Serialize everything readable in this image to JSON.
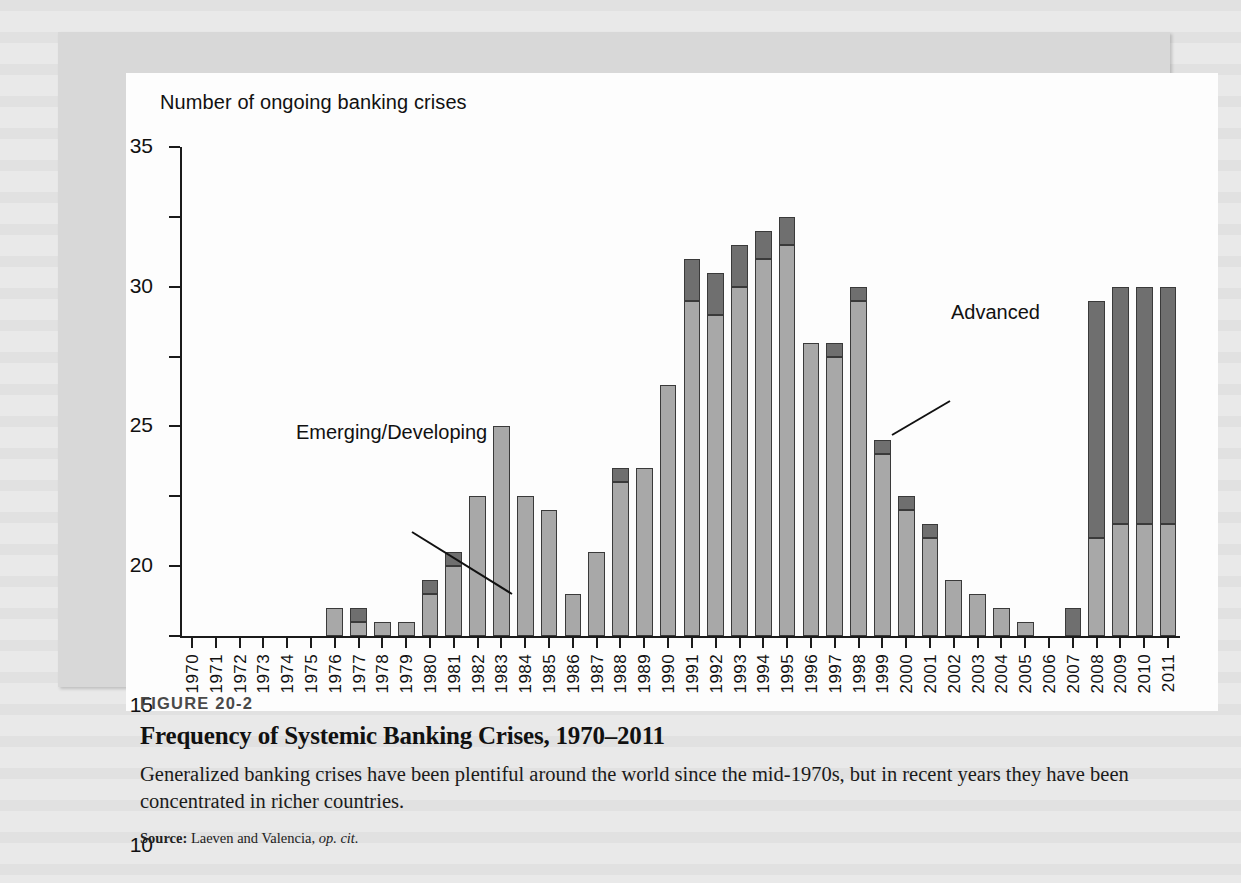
{
  "figure": {
    "number": "FIGURE 20-2",
    "title": "Frequency of Systemic Banking Crises, 1970–2011",
    "description": "Generalized banking crises have been plentiful around the world since the mid-1970s, but in recent years they have been concentrated in richer countries.",
    "source_label": "Source:",
    "source_text": "Laeven and Valencia,",
    "source_italic": "op. cit."
  },
  "annotations": {
    "emerging": "Emerging/Developing",
    "advanced": "Advanced"
  },
  "colors": {
    "emerging": "#a8a8a8",
    "advanced": "#6f6f6f",
    "axis": "#1b1b1b",
    "panel": "#fdfdfd",
    "frame": "#d8d8d8",
    "page": "#e9e9e9"
  },
  "chart_data": {
    "type": "bar",
    "subtype": "stacked-vertical",
    "title": "Frequency of Systemic Banking Crises, 1970–2011",
    "xlabel": "",
    "ylabel": "Number of ongoing banking crises",
    "ylim": [
      0,
      35
    ],
    "yticks": [
      0,
      5,
      10,
      15,
      20,
      25,
      30,
      35
    ],
    "grid": false,
    "legend": "inline-annotations",
    "categories": [
      "1970",
      "1971",
      "1972",
      "1973",
      "1974",
      "1975",
      "1976",
      "1977",
      "1978",
      "1979",
      "1980",
      "1981",
      "1982",
      "1983",
      "1984",
      "1985",
      "1986",
      "1987",
      "1988",
      "1989",
      "1990",
      "1991",
      "1992",
      "1993",
      "1994",
      "1995",
      "1996",
      "1997",
      "1998",
      "1999",
      "2000",
      "2001",
      "2002",
      "2003",
      "2004",
      "2005",
      "2006",
      "2007",
      "2008",
      "2009",
      "2010",
      "2011"
    ],
    "series": [
      {
        "name": "Emerging/Developing",
        "color": "#a8a8a8",
        "values": [
          0,
          0,
          0,
          0,
          0,
          0,
          2,
          1,
          1,
          1,
          3,
          5,
          10,
          15,
          10,
          9,
          3,
          6,
          11,
          12,
          18,
          24,
          23,
          25,
          27,
          28,
          21,
          20,
          24,
          13,
          9,
          7,
          4,
          3,
          2,
          1,
          0,
          0,
          7,
          8,
          8,
          8
        ]
      },
      {
        "name": "Advanced",
        "color": "#6f6f6f",
        "values": [
          0,
          0,
          0,
          0,
          0,
          0,
          0,
          1,
          0,
          0,
          1,
          1,
          0,
          0,
          0,
          0,
          0,
          0,
          1,
          0,
          0,
          3,
          3,
          3,
          2,
          2,
          0,
          1,
          1,
          1,
          1,
          1,
          0,
          0,
          0,
          0,
          0,
          2,
          17,
          17,
          17,
          17
        ]
      }
    ],
    "totals": [
      0,
      0,
      0,
      0,
      0,
      0,
      2,
      2,
      1,
      1,
      4,
      6,
      10,
      15,
      10,
      9,
      3,
      6,
      12,
      12,
      18,
      27,
      26,
      28,
      29,
      30,
      21,
      21,
      25,
      14,
      10,
      8,
      4,
      3,
      2,
      1,
      0,
      2,
      24,
      25,
      25,
      25
    ]
  }
}
